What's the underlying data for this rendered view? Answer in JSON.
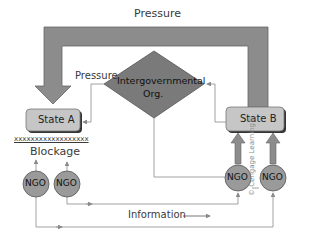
{
  "diagram": {
    "top_label": "Pressure",
    "side_label": "Pressure",
    "igo_line1": "Intergovernmental",
    "igo_line2": "Org.",
    "state_a": "State A",
    "state_b": "State B",
    "blockage_marks": "xxxxxxxxxxxxxxxxxx",
    "blockage": "Blockage",
    "ngo_label": "NGO",
    "information": "Information",
    "copyright": "© Cengage Learning®"
  },
  "colors": {
    "arrow_fill": "#8c8c8c",
    "diamond_fill": "#7a7a7a",
    "box_fill": "#c6c6c6",
    "ngo_fill": "#9a9a9a",
    "line": "#8a8a8a"
  }
}
